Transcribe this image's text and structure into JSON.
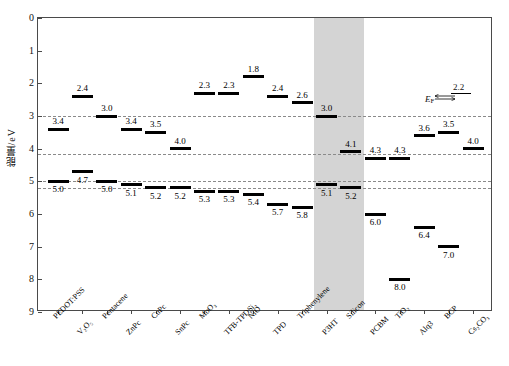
{
  "figure": {
    "ylabel": "能量/eV",
    "ytick_labels": [
      "0",
      "1",
      "2",
      "3",
      "4",
      "5",
      "6",
      "7",
      "8",
      "9"
    ],
    "fermi": {
      "symbol": "E",
      "subscript": "F",
      "value": "2.2"
    }
  },
  "chart_data": {
    "type": "bar",
    "title": "",
    "xlabel": "",
    "ylabel": "能量/eV",
    "ylim": [
      0,
      9
    ],
    "y_inverted": true,
    "grid": false,
    "legend": "none",
    "categories": [
      "PEDOT:PSS",
      "V2O5",
      "Pentacene",
      "ZnPc",
      "CuPc",
      "SnPc",
      "MoO3",
      "TFB-TPDSi2",
      "NiO",
      "TPD",
      "Triphenylene",
      "P3HT",
      "Silicon",
      "PCBM",
      "TiO2",
      "Alq3",
      "BCP",
      "Cs2CO3"
    ],
    "category_labels": [
      "PEDOT:PSS",
      "V₂O₅",
      "Pentacene",
      "ZnPc",
      "CuPc",
      "SnPc",
      "MoO₃",
      "TFB-TPDSi₂",
      "NiO",
      "TPD",
      "Triphenylene",
      "P3HT",
      "Silicon",
      "PCBM",
      "TiO₂",
      "Alq3",
      "BCP",
      "Cs₂CO₃"
    ],
    "series": [
      {
        "name": "LUMO / conduction band (eV)",
        "values": [
          3.4,
          2.4,
          3.0,
          3.4,
          3.5,
          4.0,
          2.3,
          2.3,
          1.8,
          2.4,
          2.6,
          3.0,
          4.1,
          4.3,
          4.3,
          3.6,
          3.5,
          4.0
        ]
      },
      {
        "name": "HOMO / valence band (eV)",
        "values": [
          5.0,
          4.7,
          5.0,
          5.1,
          5.2,
          5.2,
          5.3,
          5.3,
          5.4,
          5.7,
          5.8,
          5.1,
          5.2,
          6.0,
          8.0,
          6.4,
          7.0,
          null
        ]
      }
    ],
    "value_labels_upper": [
      "3.4",
      "2.4",
      "3.0",
      "3.4",
      "3.5",
      "4.0",
      "2.3",
      "2.3",
      "1.8",
      "2.4",
      "2.6",
      "3.0",
      "4.1",
      "4.3",
      "4.3",
      "3.6",
      "3.5",
      "4.0"
    ],
    "value_labels_lower": [
      "5.0",
      "4.7",
      "5.0",
      "5.1",
      "5.2",
      "5.2",
      "5.3",
      "5.3",
      "5.4",
      "5.7",
      "5.8",
      "5.1",
      "5.2",
      "6.0",
      "8.0",
      "6.4",
      "7.0",
      ""
    ],
    "reference_lines": [
      3.0,
      4.15,
      5.0,
      5.2
    ],
    "highlight_band": {
      "from_category": "P3HT",
      "to_category": "Silicon",
      "color": "#d4d4d4"
    },
    "annotations": [
      {
        "text": "E_F",
        "value": 2.2,
        "position": "top-right"
      }
    ]
  }
}
